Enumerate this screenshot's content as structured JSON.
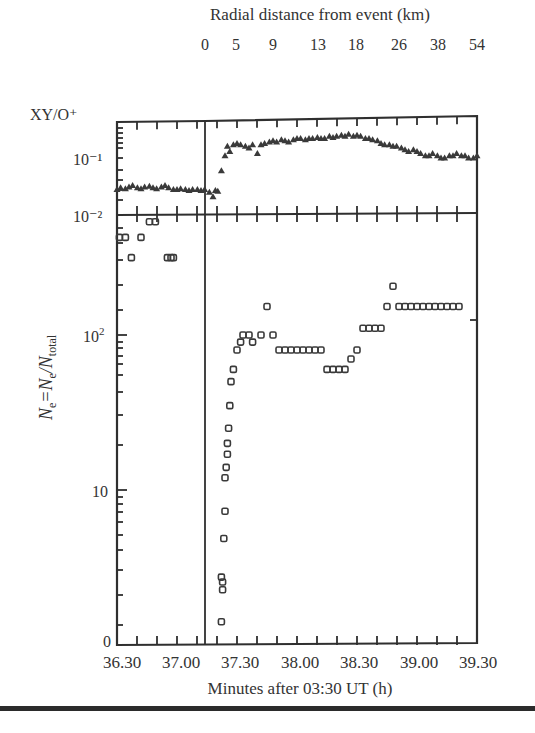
{
  "chart_data": [
    {
      "panel": "top",
      "type": "scatter",
      "marker": "triangle",
      "title": "Radial distance from event (km)",
      "ylabel": "XY/O+",
      "yscale": "log",
      "ylim": [
        0.01,
        0.4
      ],
      "ytick_labels": [
        "10⁻¹",
        "10⁻²"
      ],
      "top_xaxis_label": "Radial distance from event (km)",
      "top_xtick_labels": [
        "0",
        "5",
        "9",
        "13",
        "18",
        "26",
        "38",
        "54"
      ],
      "series": [
        {
          "name": "XY/O+",
          "x": [
            36.3,
            36.33,
            36.37,
            36.4,
            36.43,
            36.47,
            36.5,
            36.53,
            36.57,
            36.6,
            36.63,
            36.67,
            36.7,
            36.73,
            36.77,
            36.8,
            36.83,
            36.87,
            36.9,
            36.93,
            36.97,
            37.0,
            37.03,
            37.07,
            37.1,
            37.12,
            37.14,
            37.17,
            37.2,
            37.22,
            37.24,
            37.27,
            37.3,
            37.33,
            37.37,
            37.4,
            37.43,
            37.47,
            37.5,
            37.53,
            37.57,
            37.6,
            37.63,
            37.67,
            37.7,
            37.73,
            37.77,
            37.8,
            37.83,
            37.87,
            37.9,
            37.93,
            37.97,
            38.0,
            38.03,
            38.07,
            38.1,
            38.13,
            38.17,
            38.2,
            38.23,
            38.27,
            38.3,
            38.33,
            38.37,
            38.4,
            38.43,
            38.47,
            38.5,
            38.53,
            38.57,
            38.6,
            38.63,
            38.67,
            38.7,
            38.73,
            38.77,
            38.8,
            38.83,
            38.87,
            38.9,
            38.93,
            38.97,
            39.0,
            39.03,
            39.07,
            39.1,
            39.13,
            39.17,
            39.2,
            39.23,
            39.27,
            39.3
          ],
          "y": [
            0.028,
            0.03,
            0.029,
            0.031,
            0.033,
            0.03,
            0.029,
            0.031,
            0.032,
            0.03,
            0.029,
            0.031,
            0.033,
            0.03,
            0.028,
            0.028,
            0.029,
            0.028,
            0.027,
            0.028,
            0.028,
            0.027,
            0.028,
            0.025,
            0.021,
            0.027,
            0.026,
            0.06,
            0.11,
            0.16,
            0.13,
            0.17,
            0.18,
            0.17,
            0.16,
            0.15,
            0.17,
            0.12,
            0.17,
            0.18,
            0.19,
            0.2,
            0.19,
            0.21,
            0.2,
            0.19,
            0.21,
            0.22,
            0.22,
            0.21,
            0.22,
            0.22,
            0.23,
            0.22,
            0.22,
            0.24,
            0.23,
            0.24,
            0.25,
            0.24,
            0.26,
            0.24,
            0.25,
            0.24,
            0.22,
            0.22,
            0.21,
            0.2,
            0.18,
            0.17,
            0.17,
            0.16,
            0.16,
            0.15,
            0.14,
            0.13,
            0.14,
            0.13,
            0.12,
            0.11,
            0.11,
            0.12,
            0.11,
            0.1,
            0.1,
            0.11,
            0.11,
            0.12,
            0.11,
            0.11,
            0.1,
            0.1,
            0.11
          ]
        }
      ]
    },
    {
      "panel": "bottom",
      "type": "scatter",
      "marker": "open-square",
      "xlabel": "Minutes after 03:30 UT (h)",
      "ylabel": "Ne=Ne/Ntotal",
      "yscale": "log",
      "ytick_labels": [
        "10⁻²",
        "10²",
        "10",
        "0"
      ],
      "xtick_labels": [
        "36.30",
        "37.00",
        "37.30",
        "38.00",
        "38.30",
        "39.00",
        "39.30"
      ],
      "xlim": [
        36.3,
        39.3
      ],
      "event_line_x": 37.15,
      "series": [
        {
          "name": "Ne",
          "x": [
            36.32,
            36.37,
            36.42,
            36.5,
            36.57,
            36.62,
            36.72,
            36.75,
            36.77,
            37.17,
            37.17,
            37.18,
            37.18,
            37.19,
            37.2,
            37.2,
            37.21,
            37.22,
            37.22,
            37.23,
            37.24,
            37.25,
            37.27,
            37.3,
            37.33,
            37.35,
            37.4,
            37.43,
            37.5,
            37.55,
            37.6,
            37.65,
            37.7,
            37.75,
            37.8,
            37.85,
            37.9,
            37.95,
            38.0,
            38.05,
            38.1,
            38.15,
            38.2,
            38.25,
            38.3,
            38.35,
            38.4,
            38.45,
            38.5,
            38.55,
            38.6,
            38.65,
            38.7,
            38.75,
            38.8,
            38.85,
            38.9,
            38.95,
            39.0,
            39.05,
            39.1,
            39.15
          ],
          "y": [
            400,
            400,
            300,
            400,
            500,
            500,
            300,
            300,
            300,
            2.5,
            4,
            3.8,
            3.5,
            6,
            8,
            12,
            14,
            17,
            20,
            25,
            35,
            50,
            60,
            80,
            90,
            100,
            100,
            90,
            100,
            150,
            100,
            80,
            80,
            80,
            80,
            80,
            80,
            80,
            80,
            60,
            60,
            60,
            60,
            70,
            80,
            110,
            110,
            110,
            110,
            150,
            200,
            150,
            150,
            150,
            150,
            150,
            150,
            150,
            150,
            150,
            150,
            150
          ],
          "note": "values approximate, read from pixel positions on log axis"
        }
      ]
    }
  ],
  "labels": {
    "top_title": "Radial distance from event (km)",
    "km_ticks": [
      "0",
      "5",
      "9",
      "13",
      "18",
      "26",
      "38",
      "54"
    ],
    "top_ylabel": "XY/O⁺",
    "top_ytick_1": "10⁻¹",
    "top_ytick_2": "10⁻²",
    "bottom_ylabel_main": "N",
    "bottom_ylabel_sub1": "e",
    "bottom_ylabel_eq": "=N",
    "bottom_ylabel_sub2": "e",
    "bottom_ylabel_div": "/N",
    "bottom_ylabel_sub3": "total",
    "ytick_100": "10",
    "ytick_100_sup": "2",
    "ytick_10": "10",
    "ytick_0": "0",
    "x_ticks": [
      "36.30",
      "37.00",
      "37.30",
      "38.00",
      "38.30",
      "39.00",
      "39.30"
    ],
    "xlabel": "Minutes after 03:30 UT (h)"
  },
  "colors": {
    "ink": "#2f2f2f",
    "background": "#ffffff"
  }
}
